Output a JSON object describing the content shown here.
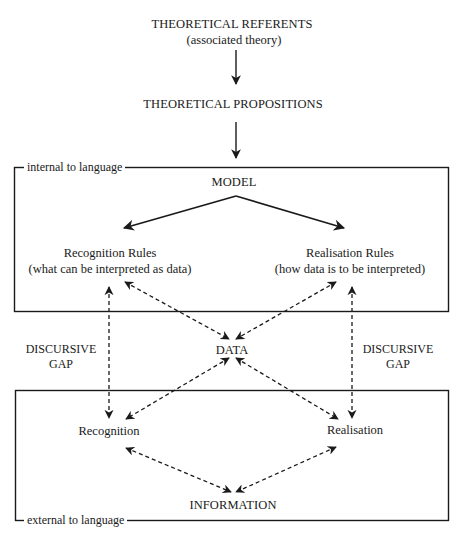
{
  "diagram": {
    "top": {
      "referents": "THEORETICAL REFERENTS",
      "referents_sub": "(associated theory)",
      "propositions": "THEORETICAL PROPOSITIONS"
    },
    "internal_box": {
      "label": "internal to language",
      "model": "MODEL",
      "recognition_rules": "Recognition Rules",
      "recognition_rules_sub": "(what can be interpreted as data)",
      "realisation_rules": "Realisation Rules",
      "realisation_rules_sub": "(how data is to be interpreted)"
    },
    "middle": {
      "left_gap_line1": "DISCURSIVE",
      "left_gap_line2": "GAP",
      "data": "DATA",
      "right_gap_line1": "DISCURSIVE",
      "right_gap_line2": "GAP"
    },
    "external_box": {
      "label": "external to language",
      "recognition": "Recognition",
      "realisation": "Realisation",
      "information": "INFORMATION"
    },
    "colors": {
      "ink": "#1a1a1a",
      "background": "#ffffff"
    }
  }
}
